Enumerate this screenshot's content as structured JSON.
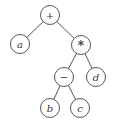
{
  "diagram": {
    "type": "expression-tree",
    "nodes": [
      {
        "id": "plus",
        "label": "+",
        "x": 50,
        "y": 15,
        "italic": false
      },
      {
        "id": "a",
        "label": "a",
        "x": 20,
        "y": 44,
        "italic": true
      },
      {
        "id": "times",
        "label": "*",
        "x": 81,
        "y": 45,
        "italic": false
      },
      {
        "id": "minus",
        "label": "−",
        "x": 64,
        "y": 77,
        "italic": false
      },
      {
        "id": "d",
        "label": "d",
        "x": 96,
        "y": 77,
        "italic": true
      },
      {
        "id": "b",
        "label": "b",
        "x": 50,
        "y": 108,
        "italic": true
      },
      {
        "id": "c",
        "label": "c",
        "x": 80,
        "y": 108,
        "italic": true
      }
    ],
    "edges": [
      [
        "plus",
        "a"
      ],
      [
        "plus",
        "times"
      ],
      [
        "times",
        "minus"
      ],
      [
        "times",
        "d"
      ],
      [
        "minus",
        "b"
      ],
      [
        "minus",
        "c"
      ]
    ],
    "node_radius": 9.5
  }
}
